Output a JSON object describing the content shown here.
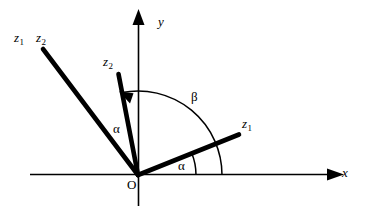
{
  "figure": {
    "kind": "vector-rotation-diagram",
    "background_color": "#ffffff",
    "stroke_color": "#000000",
    "axes": {
      "x_label": "x",
      "y_label": "y",
      "origin_label": "O"
    },
    "labels": {
      "z1_outer": "z",
      "z1_outer_sub": "1",
      "z2_outer": "z",
      "z2_outer_sub": "2",
      "z2_inner": "z",
      "z2_inner_sub": "2",
      "z1_right": "z",
      "z1_right_sub": "1",
      "alpha_left": "α",
      "alpha_right": "α",
      "beta": "β"
    },
    "vectors": [
      {
        "name": "z1-prime-long",
        "label": "z₁",
        "from": [
          138,
          175
        ],
        "to": [
          42,
          48
        ],
        "angle_deg": 127
      },
      {
        "name": "z2-prime",
        "label": "z₂",
        "from": [
          138,
          175
        ],
        "to": [
          118,
          73
        ],
        "angle_deg": 101
      },
      {
        "name": "z1",
        "label": "z₁",
        "from": [
          138,
          175
        ],
        "to": [
          240,
          134
        ],
        "angle_deg": 22
      }
    ],
    "arcs": [
      {
        "name": "beta-arc",
        "label": "β",
        "radius": 84,
        "start_deg": 0,
        "end_deg": 101,
        "has_arrowhead": true
      },
      {
        "name": "alpha-arc",
        "label": "α",
        "radius": 58,
        "start_deg": 0,
        "end_deg": 22,
        "has_arrowhead": false
      }
    ]
  }
}
